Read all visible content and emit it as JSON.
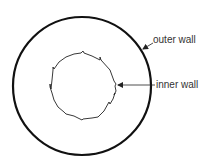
{
  "diagram": {
    "type": "cross-section",
    "labels": {
      "outer": "outer wall",
      "inner": "inner wall"
    },
    "outer_circle": {
      "cx": 82,
      "cy": 86,
      "r": 69,
      "stroke": "#111111",
      "stroke_width": 2.2
    },
    "inner_outline": {
      "cx": 83,
      "cy": 86,
      "approx_r": 34,
      "stroke": "#222222",
      "stroke_width": 0.9,
      "style": "irregular jagged polygon"
    },
    "arrows": [
      {
        "from_label": "outer wall",
        "target": "outer circle"
      },
      {
        "from_label": "inner wall",
        "target": "inner outline"
      }
    ]
  }
}
